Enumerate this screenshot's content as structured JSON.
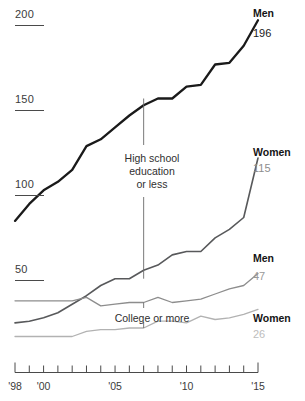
{
  "chart_data": {
    "type": "line",
    "title": "",
    "subtitle": "",
    "xlabel": "",
    "ylabel": "",
    "xlim": [
      1998,
      2015
    ],
    "ylim": [
      0,
      200
    ],
    "grid": false,
    "legend_position": "right-inline",
    "y_ticks": [
      {
        "label": "200",
        "value": 200
      },
      {
        "label": "150",
        "value": 150
      },
      {
        "label": "100",
        "value": 100
      },
      {
        "label": "50",
        "value": 50
      }
    ],
    "x_ticks": [
      {
        "label": "'98",
        "value": 1998
      },
      {
        "label": "",
        "value": 1999
      },
      {
        "label": "'00",
        "value": 2000
      },
      {
        "label": "",
        "value": 2001
      },
      {
        "label": "",
        "value": 2002
      },
      {
        "label": "",
        "value": 2003
      },
      {
        "label": "",
        "value": 2004
      },
      {
        "label": "'05",
        "value": 2005
      },
      {
        "label": "",
        "value": 2006
      },
      {
        "label": "",
        "value": 2007
      },
      {
        "label": "",
        "value": 2008
      },
      {
        "label": "",
        "value": 2009
      },
      {
        "label": "'10",
        "value": 2010
      },
      {
        "label": "",
        "value": 2011
      },
      {
        "label": "",
        "value": 2012
      },
      {
        "label": "",
        "value": 2013
      },
      {
        "label": "",
        "value": 2014
      },
      {
        "label": "'15",
        "value": 2015
      }
    ],
    "x": [
      1998,
      1999,
      2000,
      2001,
      2002,
      2003,
      2004,
      2005,
      2006,
      2007,
      2008,
      2009,
      2010,
      2011,
      2012,
      2013,
      2014,
      2015
    ],
    "series": [
      {
        "name": "Men",
        "group": "High school education or less",
        "end_value": 196,
        "end_label": "196",
        "color": "#1a1a1a",
        "width": 2.3,
        "values": [
          78,
          88,
          96,
          101,
          108,
          122,
          126,
          133,
          140,
          146,
          150,
          150,
          157,
          158,
          170,
          171,
          181,
          196
        ]
      },
      {
        "name": "Women",
        "group": "High school education or less",
        "end_value": 115,
        "end_label": "115",
        "color": "#58595b",
        "width": 1.6,
        "values": [
          18,
          19,
          21,
          24,
          29,
          34,
          40,
          44,
          44,
          49,
          52,
          58,
          60,
          60,
          68,
          73,
          80,
          115
        ]
      },
      {
        "name": "Men",
        "group": "College or more",
        "end_value": 47,
        "end_label": "47",
        "color": "#8d8d8d",
        "width": 1.3,
        "values": [
          31,
          31,
          31,
          31,
          31,
          33,
          28,
          29,
          30,
          30,
          33,
          30,
          31,
          32,
          35,
          38,
          40,
          47
        ]
      },
      {
        "name": "Women",
        "group": "College or more",
        "end_value": 26,
        "end_label": "26",
        "color": "#b2b2b2",
        "width": 1.3,
        "values": [
          10,
          10,
          10,
          10,
          10,
          13,
          14,
          14,
          15,
          15,
          19,
          19,
          18,
          22,
          20,
          21,
          23,
          26
        ]
      }
    ],
    "annotations": [
      {
        "id": "hs-annotation",
        "lines": [
          "High school",
          "education",
          "or less"
        ],
        "x": 2007,
        "leader_top_value": 150,
        "leader_bottom_value": 44
      },
      {
        "id": "college-annotation",
        "lines": [
          "College or more"
        ],
        "x": 2007,
        "leader_top_value": 30,
        "leader_bottom_value": 15
      }
    ],
    "value_label_colors": {
      "men_hs": "#1a1a1a",
      "women_hs": "#8d8d8d",
      "men_college": "#9a9a9a",
      "women_college": "#bdbdbd"
    },
    "axis_color": "#4a4a4a"
  }
}
